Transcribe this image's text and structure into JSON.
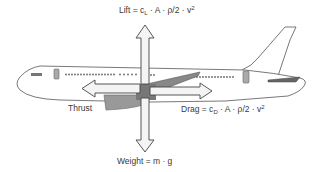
{
  "diagram": {
    "type": "forces-on-airplane",
    "colors": {
      "outline": "#444444",
      "wing_fill": "#8a8a8a",
      "arrow_fill": "#f4f4f4",
      "window_fill": "#999999",
      "background": "#ffffff"
    },
    "labels": {
      "lift": {
        "prefix": "Lift = c",
        "sub": "L",
        "suffix": " · A · ρ/2 · v",
        "sup": "2"
      },
      "drag": {
        "prefix": "Drag = c",
        "sub": "D",
        "suffix": " · A · ρ/2 · v",
        "sup": "2"
      },
      "thrust": {
        "text": "Thrust"
      },
      "weight": {
        "text": "Weight = m · g"
      }
    },
    "forces": [
      {
        "name": "Lift",
        "direction": "up"
      },
      {
        "name": "Weight",
        "direction": "down"
      },
      {
        "name": "Thrust",
        "direction": "left"
      },
      {
        "name": "Drag",
        "direction": "right"
      }
    ]
  }
}
